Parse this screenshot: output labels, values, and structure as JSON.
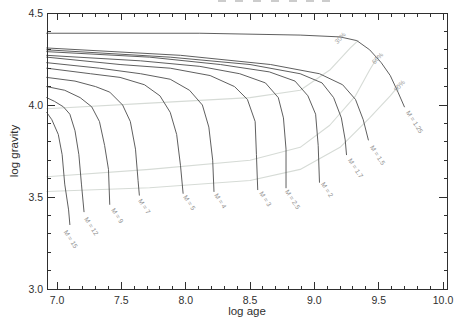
{
  "figure": {
    "width": 465,
    "height": 330,
    "background": "#ffffff",
    "axis_color": "#2f2f2f",
    "track_color": "#4d4d4d",
    "fraction_line_color": "#d6dbd6",
    "track_label_color": "#8e8e8e",
    "fraction_label_color": "#9a9a9a"
  },
  "clipped_title": {
    "fragment_xs": [
      218,
      235,
      253,
      271,
      289,
      306,
      322
    ]
  },
  "chart_data": {
    "type": "line",
    "title": "",
    "xlabel": "log age",
    "ylabel": "log gravity",
    "xlim": [
      6.92,
      10.03
    ],
    "ylim": [
      3.0,
      4.5
    ],
    "grid": false,
    "x_major_ticks": [
      7.0,
      7.5,
      8.0,
      8.5,
      9.0,
      9.5,
      10.0
    ],
    "x_tick_labels": [
      "7.0",
      "7.5",
      "8.0",
      "8.5",
      "9.0",
      "9.5",
      "10.0"
    ],
    "x_minor_tick_step": 0.1,
    "y_major_ticks": [
      3.0,
      3.5,
      4.0,
      4.5
    ],
    "y_tick_labels": [
      "3.0",
      "3.5",
      "4.0",
      "4.5"
    ],
    "y_minor_tick_step": 0.1,
    "series": [
      {
        "label": "M = 15",
        "mass": 15,
        "points": [
          [
            6.92,
            3.96
          ],
          [
            6.96,
            3.92
          ],
          [
            7.01,
            3.84
          ],
          [
            7.04,
            3.73
          ],
          [
            7.06,
            3.57
          ],
          [
            7.09,
            3.43
          ],
          [
            7.1,
            3.35
          ]
        ],
        "label_pos": {
          "x": 7.05,
          "g": 3.31,
          "rot": 57
        }
      },
      {
        "label": "M = 12",
        "mass": 12,
        "points": [
          [
            6.92,
            4.04
          ],
          [
            6.98,
            4.02
          ],
          [
            7.05,
            3.99
          ],
          [
            7.1,
            3.95
          ],
          [
            7.14,
            3.86
          ],
          [
            7.17,
            3.73
          ],
          [
            7.19,
            3.57
          ],
          [
            7.21,
            3.42
          ]
        ],
        "label_pos": {
          "x": 7.21,
          "g": 3.38,
          "rot": 57
        }
      },
      {
        "label": "M = 9",
        "mass": 9,
        "points": [
          [
            6.92,
            4.1
          ],
          [
            7.06,
            4.08
          ],
          [
            7.18,
            4.04
          ],
          [
            7.27,
            3.99
          ],
          [
            7.33,
            3.91
          ],
          [
            7.37,
            3.78
          ],
          [
            7.4,
            3.65
          ],
          [
            7.41,
            3.46
          ]
        ],
        "label_pos": {
          "x": 7.42,
          "g": 3.43,
          "rot": 57
        }
      },
      {
        "label": "M = 7",
        "mass": 7,
        "points": [
          [
            6.92,
            4.15
          ],
          [
            7.14,
            4.13
          ],
          [
            7.3,
            4.1
          ],
          [
            7.41,
            4.07
          ],
          [
            7.51,
            4.0
          ],
          [
            7.57,
            3.91
          ],
          [
            7.61,
            3.76
          ],
          [
            7.63,
            3.59
          ],
          [
            7.64,
            3.51
          ]
        ],
        "label_pos": {
          "x": 7.63,
          "g": 3.48,
          "rot": 57
        }
      },
      {
        "label": "M = 5",
        "mass": 5,
        "points": [
          [
            6.92,
            4.2
          ],
          [
            7.26,
            4.17
          ],
          [
            7.49,
            4.15
          ],
          [
            7.68,
            4.11
          ],
          [
            7.8,
            4.05
          ],
          [
            7.88,
            3.96
          ],
          [
            7.93,
            3.84
          ],
          [
            7.96,
            3.67
          ],
          [
            7.98,
            3.52
          ]
        ],
        "label_pos": {
          "x": 7.98,
          "g": 3.5,
          "rot": 57
        }
      },
      {
        "label": "M = 4",
        "mass": 4,
        "points": [
          [
            6.92,
            4.23
          ],
          [
            7.33,
            4.2
          ],
          [
            7.65,
            4.17
          ],
          [
            7.88,
            4.14
          ],
          [
            8.03,
            4.08
          ],
          [
            8.13,
            4.0
          ],
          [
            8.18,
            3.88
          ],
          [
            8.21,
            3.7
          ],
          [
            8.22,
            3.53
          ]
        ],
        "label_pos": {
          "x": 8.22,
          "g": 3.51,
          "rot": 57
        }
      },
      {
        "label": "M = 3",
        "mass": 3,
        "points": [
          [
            6.92,
            4.26
          ],
          [
            7.49,
            4.22
          ],
          [
            7.88,
            4.2
          ],
          [
            8.19,
            4.16
          ],
          [
            8.38,
            4.1
          ],
          [
            8.48,
            4.03
          ],
          [
            8.54,
            3.91
          ],
          [
            8.55,
            3.73
          ],
          [
            8.56,
            3.54
          ]
        ],
        "label_pos": {
          "x": 8.57,
          "g": 3.52,
          "rot": 57
        }
      },
      {
        "label": "M = 2.5",
        "mass": 2.5,
        "points": [
          [
            6.92,
            4.27
          ],
          [
            7.65,
            4.24
          ],
          [
            8.11,
            4.21
          ],
          [
            8.42,
            4.17
          ],
          [
            8.62,
            4.12
          ],
          [
            8.72,
            4.04
          ],
          [
            8.76,
            3.93
          ],
          [
            8.78,
            3.76
          ],
          [
            8.78,
            3.55
          ]
        ],
        "label_pos": {
          "x": 8.77,
          "g": 3.53,
          "rot": 57
        }
      },
      {
        "label": "M = 2",
        "mass": 2,
        "points": [
          [
            6.92,
            4.29
          ],
          [
            7.72,
            4.26
          ],
          [
            8.27,
            4.22
          ],
          [
            8.65,
            4.18
          ],
          [
            8.85,
            4.13
          ],
          [
            8.95,
            4.05
          ],
          [
            9.01,
            3.95
          ],
          [
            9.03,
            3.78
          ],
          [
            9.04,
            3.58
          ]
        ],
        "label_pos": {
          "x": 9.05,
          "g": 3.57,
          "rot": 57
        }
      },
      {
        "label": "M = 1.7",
        "mass": 1.7,
        "points": [
          [
            6.92,
            4.3
          ],
          [
            7.88,
            4.26
          ],
          [
            8.5,
            4.22
          ],
          [
            8.89,
            4.17
          ],
          [
            9.06,
            4.12
          ],
          [
            9.15,
            4.04
          ],
          [
            9.21,
            3.93
          ],
          [
            9.24,
            3.81
          ],
          [
            9.25,
            3.73
          ]
        ],
        "label_pos": {
          "x": 9.26,
          "g": 3.7,
          "rot": 57
        }
      },
      {
        "label": "M = 1.5",
        "mass": 1.5,
        "points": [
          [
            6.92,
            4.31
          ],
          [
            7.96,
            4.27
          ],
          [
            8.66,
            4.22
          ],
          [
            9.04,
            4.17
          ],
          [
            9.22,
            4.11
          ],
          [
            9.32,
            4.03
          ],
          [
            9.38,
            3.92
          ],
          [
            9.42,
            3.81
          ]
        ],
        "label_pos": {
          "x": 9.43,
          "g": 3.77,
          "rot": 57
        }
      },
      {
        "label": "M = 1.25",
        "mass": 1.25,
        "points": [
          [
            6.92,
            4.39
          ],
          [
            8.11,
            4.39
          ],
          [
            8.89,
            4.38
          ],
          [
            9.2,
            4.37
          ],
          [
            9.33,
            4.35
          ],
          [
            9.43,
            4.3
          ],
          [
            9.52,
            4.23
          ],
          [
            9.59,
            4.16
          ],
          [
            9.65,
            4.07
          ],
          [
            9.7,
            3.99
          ]
        ],
        "label_pos": {
          "x": 9.71,
          "g": 3.96,
          "rot": 57
        }
      }
    ],
    "fraction_lines": [
      {
        "label": "30%",
        "points": [
          [
            6.92,
            3.98
          ],
          [
            7.72,
            4.01
          ],
          [
            8.5,
            4.04
          ],
          [
            8.89,
            4.08
          ],
          [
            9.12,
            4.19
          ],
          [
            9.28,
            4.31
          ],
          [
            9.34,
            4.35
          ]
        ],
        "label_pos": {
          "x": 9.18,
          "g": 4.33,
          "rot": -48
        }
      },
      {
        "label": "60%",
        "points": [
          [
            6.92,
            3.61
          ],
          [
            7.72,
            3.65
          ],
          [
            8.5,
            3.7
          ],
          [
            8.89,
            3.77
          ],
          [
            9.12,
            3.89
          ],
          [
            9.32,
            4.05
          ],
          [
            9.43,
            4.19
          ],
          [
            9.49,
            4.26
          ]
        ],
        "label_pos": {
          "x": 9.47,
          "g": 4.22,
          "rot": -48
        }
      },
      {
        "label": "90%",
        "points": [
          [
            6.92,
            3.53
          ],
          [
            7.72,
            3.55
          ],
          [
            8.5,
            3.59
          ],
          [
            8.89,
            3.65
          ],
          [
            9.2,
            3.77
          ],
          [
            9.43,
            3.93
          ],
          [
            9.59,
            4.05
          ],
          [
            9.65,
            4.1
          ]
        ],
        "label_pos": {
          "x": 9.64,
          "g": 4.07,
          "rot": -48
        }
      }
    ]
  }
}
